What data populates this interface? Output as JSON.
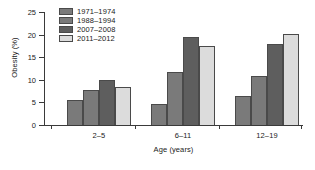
{
  "chart_data": {
    "type": "bar",
    "title": "",
    "xlabel": "Age (years)",
    "ylabel": "Obesity (%)",
    "categories": [
      "2–5",
      "6–11",
      "12–19"
    ],
    "series": [
      {
        "name": "1971–1974",
        "color": "#7a7a7a",
        "values": [
          5.5,
          4.6,
          6.5
        ]
      },
      {
        "name": "1988–1994",
        "color": "#7a7a7a",
        "values": [
          7.8,
          11.8,
          10.9
        ]
      },
      {
        "name": "2007–2008",
        "color": "#5e5e5e",
        "values": [
          10.0,
          19.4,
          18.0
        ]
      },
      {
        "name": "2011–2012",
        "color": "#dcdcdc",
        "values": [
          8.3,
          17.4,
          20.2
        ]
      }
    ],
    "ylim": [
      0,
      25
    ],
    "yticks": [
      0,
      5,
      10,
      15,
      20,
      25
    ],
    "ytick_labels": [
      "0",
      "5",
      "10",
      "15",
      "20",
      "25"
    ],
    "grid": false,
    "legend_position": "upper-left-inside"
  },
  "axes": {
    "y_title": "Obesity (%)",
    "x_title": "Age (years)"
  }
}
